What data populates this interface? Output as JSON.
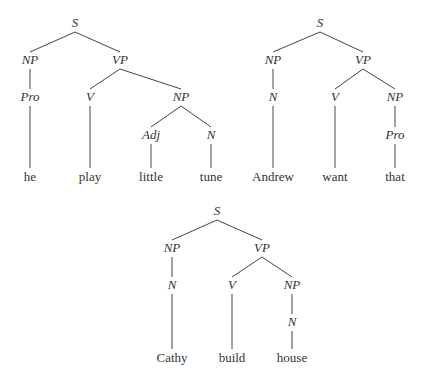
{
  "trees": [
    {
      "id": "tree-1",
      "sentence": [
        "he",
        "play",
        "little",
        "tune"
      ],
      "nodes": [
        {
          "id": "S",
          "label": "S",
          "x": 75,
          "y": 26,
          "type": "cat"
        },
        {
          "id": "NP1",
          "label": "NP",
          "x": 30,
          "y": 63,
          "type": "cat"
        },
        {
          "id": "VP",
          "label": "VP",
          "x": 120,
          "y": 63,
          "type": "cat"
        },
        {
          "id": "Pro",
          "label": "Pro",
          "x": 30,
          "y": 100,
          "type": "cat"
        },
        {
          "id": "V",
          "label": "V",
          "x": 90,
          "y": 100,
          "type": "cat"
        },
        {
          "id": "NP2",
          "label": "NP",
          "x": 181,
          "y": 100,
          "type": "cat"
        },
        {
          "id": "Adj",
          "label": "Adj",
          "x": 151,
          "y": 138,
          "type": "cat"
        },
        {
          "id": "N",
          "label": "N",
          "x": 211,
          "y": 138,
          "type": "cat"
        },
        {
          "id": "w1",
          "label": "he",
          "x": 30,
          "y": 180,
          "type": "word"
        },
        {
          "id": "w2",
          "label": "play",
          "x": 90,
          "y": 180,
          "type": "word"
        },
        {
          "id": "w3",
          "label": "little",
          "x": 151,
          "y": 180,
          "type": "word"
        },
        {
          "id": "w4",
          "label": "tune",
          "x": 211,
          "y": 180,
          "type": "word"
        }
      ],
      "edges": [
        [
          "S",
          "NP1"
        ],
        [
          "S",
          "VP"
        ],
        [
          "NP1",
          "Pro"
        ],
        [
          "Pro",
          "w1"
        ],
        [
          "VP",
          "V"
        ],
        [
          "VP",
          "NP2"
        ],
        [
          "V",
          "w2"
        ],
        [
          "NP2",
          "Adj"
        ],
        [
          "NP2",
          "N"
        ],
        [
          "Adj",
          "w3"
        ],
        [
          "N",
          "w4"
        ]
      ]
    },
    {
      "id": "tree-2",
      "sentence": [
        "Andrew",
        "want",
        "that"
      ],
      "nodes": [
        {
          "id": "S",
          "label": "S",
          "x": 320,
          "y": 26,
          "type": "cat"
        },
        {
          "id": "NP1",
          "label": "NP",
          "x": 273,
          "y": 63,
          "type": "cat"
        },
        {
          "id": "VP",
          "label": "VP",
          "x": 363,
          "y": 63,
          "type": "cat"
        },
        {
          "id": "N",
          "label": "N",
          "x": 273,
          "y": 100,
          "type": "cat"
        },
        {
          "id": "V",
          "label": "V",
          "x": 335,
          "y": 100,
          "type": "cat"
        },
        {
          "id": "NP2",
          "label": "NP",
          "x": 395,
          "y": 100,
          "type": "cat"
        },
        {
          "id": "Pro",
          "label": "Pro",
          "x": 395,
          "y": 138,
          "type": "cat"
        },
        {
          "id": "w1",
          "label": "Andrew",
          "x": 273,
          "y": 180,
          "type": "word"
        },
        {
          "id": "w2",
          "label": "want",
          "x": 335,
          "y": 180,
          "type": "word"
        },
        {
          "id": "w3",
          "label": "that",
          "x": 395,
          "y": 180,
          "type": "word"
        }
      ],
      "edges": [
        [
          "S",
          "NP1"
        ],
        [
          "S",
          "VP"
        ],
        [
          "NP1",
          "N"
        ],
        [
          "N",
          "w1"
        ],
        [
          "VP",
          "V"
        ],
        [
          "VP",
          "NP2"
        ],
        [
          "V",
          "w2"
        ],
        [
          "NP2",
          "Pro"
        ],
        [
          "Pro",
          "w3"
        ]
      ]
    },
    {
      "id": "tree-3",
      "sentence": [
        "Cathy",
        "build",
        "house"
      ],
      "nodes": [
        {
          "id": "S",
          "label": "S",
          "x": 217,
          "y": 214,
          "type": "cat"
        },
        {
          "id": "NP1",
          "label": "NP",
          "x": 172,
          "y": 251,
          "type": "cat"
        },
        {
          "id": "VP",
          "label": "VP",
          "x": 262,
          "y": 251,
          "type": "cat"
        },
        {
          "id": "N1",
          "label": "N",
          "x": 172,
          "y": 288,
          "type": "cat"
        },
        {
          "id": "V",
          "label": "V",
          "x": 232,
          "y": 288,
          "type": "cat"
        },
        {
          "id": "NP2",
          "label": "NP",
          "x": 292,
          "y": 288,
          "type": "cat"
        },
        {
          "id": "N2",
          "label": "N",
          "x": 292,
          "y": 325,
          "type": "cat"
        },
        {
          "id": "w1",
          "label": "Cathy",
          "x": 172,
          "y": 361,
          "type": "word"
        },
        {
          "id": "w2",
          "label": "build",
          "x": 232,
          "y": 361,
          "type": "word"
        },
        {
          "id": "w3",
          "label": "house",
          "x": 292,
          "y": 361,
          "type": "word"
        }
      ],
      "edges": [
        [
          "S",
          "NP1"
        ],
        [
          "S",
          "VP"
        ],
        [
          "NP1",
          "N1"
        ],
        [
          "N1",
          "w1"
        ],
        [
          "VP",
          "V"
        ],
        [
          "VP",
          "NP2"
        ],
        [
          "V",
          "w2"
        ],
        [
          "NP2",
          "N2"
        ],
        [
          "N2",
          "w3"
        ]
      ]
    }
  ]
}
